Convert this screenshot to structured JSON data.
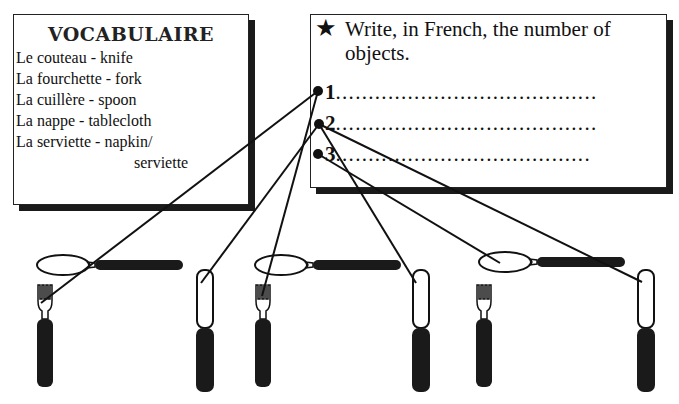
{
  "vocabulary": {
    "title": "VOCABULAIRE",
    "items": [
      {
        "text": "Le couteau - knife"
      },
      {
        "text": "La fourchette - fork"
      },
      {
        "text": "La cuillère - spoon"
      },
      {
        "text": "La nappe - tablecloth"
      },
      {
        "text": "La serviette - napkin/"
      },
      {
        "text": "serviette"
      }
    ]
  },
  "task": {
    "icon": "star-icon",
    "instruction": "Write, in French, the number of objects.",
    "answers": [
      {
        "number": "1",
        "dots": "........................................"
      },
      {
        "number": "2",
        "dots": "........................................"
      },
      {
        "number": "3",
        "dots": "......................................."
      }
    ]
  },
  "illustration": {
    "objects": [
      "spoon",
      "fork",
      "knife",
      "spoon",
      "fork",
      "knife",
      "spoon",
      "fork",
      "knife"
    ],
    "connectors": [
      {
        "from": "1",
        "to": "fork-1"
      },
      {
        "from": "1",
        "to": "knife-2"
      },
      {
        "from": "2",
        "to": "fork-2"
      },
      {
        "from": "2",
        "to": "spoon-3"
      },
      {
        "from": "2",
        "to": "knife-3"
      },
      {
        "from": "3",
        "to": "knife-2b"
      }
    ]
  }
}
